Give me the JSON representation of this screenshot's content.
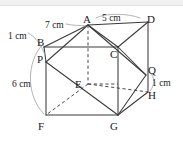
{
  "figure": {
    "type": "geometry-diagram",
    "background_color": "#ffffff",
    "stroke_color": "#3a3a3a",
    "leader_color": "#9a9a9a",
    "vertex_labels": [
      {
        "name": "A",
        "text": "A",
        "x": 83,
        "y": 14
      },
      {
        "name": "B",
        "text": "B",
        "x": 37,
        "y": 37
      },
      {
        "name": "C",
        "text": "C",
        "x": 110,
        "y": 49
      },
      {
        "name": "D",
        "text": "D",
        "x": 147,
        "y": 14
      },
      {
        "name": "E",
        "text": "E",
        "x": 75,
        "y": 79
      },
      {
        "name": "F",
        "text": "F",
        "x": 38,
        "y": 121
      },
      {
        "name": "G",
        "text": "G",
        "x": 110,
        "y": 121
      },
      {
        "name": "H",
        "text": "H",
        "x": 148,
        "y": 90
      },
      {
        "name": "P",
        "text": "P",
        "x": 37,
        "y": 54
      },
      {
        "name": "Q",
        "text": "Q",
        "x": 148,
        "y": 65
      }
    ],
    "dimension_labels": [
      {
        "name": "ad-length",
        "text": "5 cm",
        "x": 102,
        "y": 13
      },
      {
        "name": "ba-length",
        "text": "7 cm",
        "x": 45,
        "y": 20
      },
      {
        "name": "bp-length",
        "text": "1 cm",
        "x": 8,
        "y": 31
      },
      {
        "name": "pf-length",
        "text": "6 cm",
        "x": 12,
        "y": 79
      },
      {
        "name": "qh-length",
        "text": "1 cm",
        "x": 152,
        "y": 78
      }
    ]
  },
  "geometry": {
    "points": {
      "A": [
        88,
        25
      ],
      "B": [
        44,
        47
      ],
      "C": [
        118,
        48
      ],
      "D": [
        148,
        22
      ],
      "E": [
        88,
        84
      ],
      "F": [
        46,
        115
      ],
      "G": [
        118,
        115
      ],
      "H": [
        148,
        92
      ],
      "P": [
        46,
        62
      ],
      "Q": [
        146,
        75
      ]
    },
    "solid_edges": [
      [
        "B",
        "C"
      ],
      [
        "C",
        "G"
      ],
      [
        "G",
        "F"
      ],
      [
        "F",
        "P"
      ],
      [
        "P",
        "B"
      ],
      [
        "A",
        "D"
      ],
      [
        "D",
        "H"
      ],
      [
        "A",
        "B"
      ],
      [
        "A",
        "C"
      ],
      [
        "D",
        "C"
      ],
      [
        "H",
        "G"
      ],
      [
        "Q",
        "G"
      ],
      [
        "H",
        "Q"
      ],
      [
        "P",
        "A"
      ],
      [
        "P",
        "G"
      ],
      [
        "G",
        "Q"
      ],
      [
        "C",
        "Q"
      ],
      [
        "A",
        "Q"
      ]
    ],
    "hidden_edges": [
      [
        "A",
        "E"
      ],
      [
        "E",
        "F"
      ],
      [
        "E",
        "G"
      ],
      [
        "E",
        "H"
      ]
    ]
  }
}
